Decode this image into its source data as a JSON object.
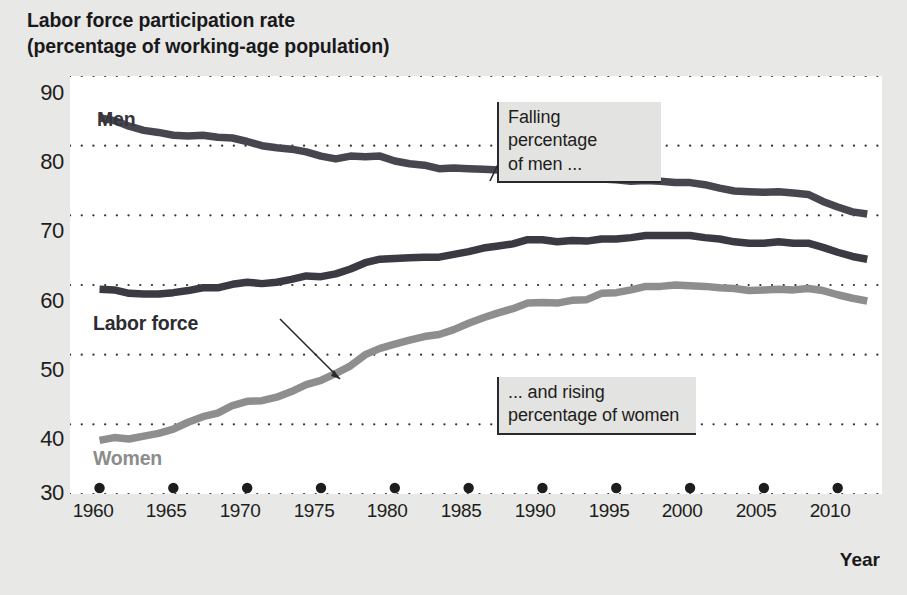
{
  "title": {
    "line1": "Labor force participation rate",
    "line2": "(percentage of working-age population)"
  },
  "axis": {
    "x_title": "Year",
    "y_ticks": [
      "90",
      "80",
      "70",
      "60",
      "50",
      "40",
      "30"
    ],
    "x_ticks": [
      "1960",
      "1965",
      "1970",
      "1975",
      "1980",
      "1985",
      "1990",
      "1995",
      "2000",
      "2005",
      "2010"
    ]
  },
  "series_labels": {
    "men": "Men",
    "labor_force": "Labor force",
    "women": "Women"
  },
  "annotations": {
    "men": "Falling percentage\nof men ...",
    "women": "... and rising\npercentage of women"
  },
  "colors": {
    "men_line": "#46464e",
    "labor_force_line": "#3a3a42",
    "women_line": "#8e8e8e",
    "gridline": "#33333a",
    "plot_background": "#ffffff",
    "page_background": "#e8e8e6",
    "annotation_background": "#e3e3e1",
    "text": "#1d1d20"
  },
  "chart_data": {
    "type": "line",
    "title": "Labor force participation rate (percentage of working-age population)",
    "xlabel": "Year",
    "ylabel": "",
    "xlim": [
      1958,
      2013
    ],
    "ylim": [
      30,
      90
    ],
    "grid": "horizontal-dotted",
    "legend": "inline-labels",
    "x": [
      1960,
      1961,
      1962,
      1963,
      1964,
      1965,
      1966,
      1967,
      1968,
      1969,
      1970,
      1971,
      1972,
      1973,
      1974,
      1975,
      1976,
      1977,
      1978,
      1979,
      1980,
      1981,
      1982,
      1983,
      1984,
      1985,
      1986,
      1987,
      1988,
      1989,
      1990,
      1991,
      1992,
      1993,
      1994,
      1995,
      1996,
      1997,
      1998,
      1999,
      2000,
      2001,
      2002,
      2003,
      2004,
      2005,
      2006,
      2007,
      2008,
      2009,
      2010,
      2011,
      2012
    ],
    "series": [
      {
        "name": "Men",
        "color": "#46464e",
        "values": [
          84.0,
          83.6,
          82.8,
          82.2,
          81.9,
          81.5,
          81.4,
          81.5,
          81.2,
          81.1,
          80.6,
          80.0,
          79.7,
          79.5,
          79.1,
          78.5,
          78.1,
          78.5,
          78.4,
          78.5,
          77.8,
          77.4,
          77.2,
          76.7,
          76.8,
          76.7,
          76.6,
          76.5,
          76.4,
          76.6,
          76.4,
          75.8,
          75.8,
          75.4,
          75.2,
          75.1,
          74.9,
          75.0,
          74.9,
          74.7,
          74.7,
          74.4,
          73.9,
          73.5,
          73.4,
          73.3,
          73.4,
          73.2,
          73.0,
          72.0,
          71.2,
          70.5,
          70.2
        ]
      },
      {
        "name": "Labor force",
        "color": "#3a3a42",
        "values": [
          59.4,
          59.3,
          58.8,
          58.7,
          58.7,
          58.9,
          59.2,
          59.6,
          59.6,
          60.1,
          60.4,
          60.2,
          60.4,
          60.8,
          61.3,
          61.2,
          61.6,
          62.3,
          63.2,
          63.7,
          63.8,
          63.9,
          64.0,
          64.0,
          64.4,
          64.8,
          65.3,
          65.6,
          65.9,
          66.5,
          66.5,
          66.2,
          66.4,
          66.3,
          66.6,
          66.6,
          66.8,
          67.1,
          67.1,
          67.1,
          67.1,
          66.8,
          66.6,
          66.2,
          66.0,
          66.0,
          66.2,
          66.0,
          66.0,
          65.4,
          64.7,
          64.1,
          63.7
        ]
      },
      {
        "name": "Women",
        "color": "#8e8e8e",
        "values": [
          37.7,
          38.1,
          37.9,
          38.3,
          38.7,
          39.3,
          40.3,
          41.1,
          41.6,
          42.7,
          43.3,
          43.4,
          43.9,
          44.7,
          45.7,
          46.3,
          47.3,
          48.4,
          50.0,
          50.9,
          51.5,
          52.1,
          52.6,
          52.9,
          53.6,
          54.5,
          55.3,
          56.0,
          56.6,
          57.4,
          57.5,
          57.4,
          57.8,
          57.9,
          58.8,
          58.9,
          59.3,
          59.8,
          59.8,
          60.0,
          59.9,
          59.8,
          59.6,
          59.5,
          59.2,
          59.3,
          59.4,
          59.3,
          59.5,
          59.2,
          58.6,
          58.1,
          57.7
        ]
      }
    ]
  }
}
